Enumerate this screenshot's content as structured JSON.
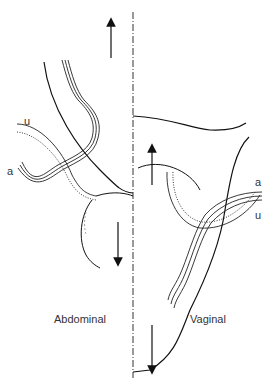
{
  "diagram": {
    "type": "anatomical-illustration",
    "left_panel": {
      "title": "Abdominal",
      "vessel_labels": {
        "ureter": "u",
        "artery": "a"
      },
      "arrows": [
        "up",
        "down"
      ]
    },
    "right_panel": {
      "title": "Vaginal",
      "vessel_labels": {
        "artery": "a",
        "ureter": "u"
      },
      "arrows": [
        "up",
        "down"
      ]
    },
    "divider": "dash-dot vertical midline"
  }
}
